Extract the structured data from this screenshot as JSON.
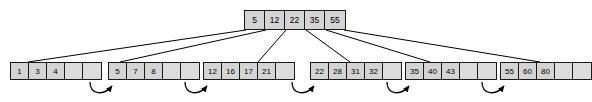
{
  "diagram": {
    "kind": "b-plus-tree",
    "title": "",
    "colors": {
      "cell_fill": "#d4d4d4",
      "empty_cell_fill": "#dcdcdc",
      "border": "#1a1a1a",
      "background": "#ffffff",
      "edge": "#000000"
    },
    "root": {
      "name": "root-node",
      "keys": [
        "5",
        "12",
        "22",
        "35",
        "55"
      ],
      "slots": 5,
      "empty_slots": 0
    },
    "leaves": [
      {
        "name": "leaf-node-1",
        "keys": [
          "1",
          "3",
          "4"
        ],
        "slots": 5,
        "empty_slots": 2
      },
      {
        "name": "leaf-node-2",
        "keys": [
          "5",
          "7",
          "8"
        ],
        "slots": 5,
        "empty_slots": 2
      },
      {
        "name": "leaf-node-3",
        "keys": [
          "12",
          "16",
          "17",
          "21"
        ],
        "slots": 5,
        "empty_slots": 1
      },
      {
        "name": "leaf-node-4",
        "keys": [
          "22",
          "28",
          "31",
          "32"
        ],
        "slots": 5,
        "empty_slots": 1
      },
      {
        "name": "leaf-node-5",
        "keys": [
          "35",
          "40",
          "43"
        ],
        "slots": 5,
        "empty_slots": 2
      },
      {
        "name": "leaf-node-6",
        "keys": [
          "55",
          "60",
          "80"
        ],
        "slots": 5,
        "empty_slots": 2
      }
    ],
    "sibling_links": [
      {
        "name": "sibling-pointer-1-2",
        "from": "leaf-node-1",
        "to": "leaf-node-2"
      },
      {
        "name": "sibling-pointer-2-3",
        "from": "leaf-node-2",
        "to": "leaf-node-3"
      },
      {
        "name": "sibling-pointer-3-4",
        "from": "leaf-node-3",
        "to": "leaf-node-4"
      },
      {
        "name": "sibling-pointer-4-5",
        "from": "leaf-node-4",
        "to": "leaf-node-5"
      },
      {
        "name": "sibling-pointer-5-6",
        "from": "leaf-node-5",
        "to": "leaf-node-6"
      }
    ],
    "child_links": [
      {
        "name": "child-pointer-1",
        "from": "root-node",
        "to": "leaf-node-1"
      },
      {
        "name": "child-pointer-2",
        "from": "root-node",
        "to": "leaf-node-2"
      },
      {
        "name": "child-pointer-3",
        "from": "root-node",
        "to": "leaf-node-3"
      },
      {
        "name": "child-pointer-4",
        "from": "root-node",
        "to": "leaf-node-4"
      },
      {
        "name": "child-pointer-5",
        "from": "root-node",
        "to": "leaf-node-5"
      },
      {
        "name": "child-pointer-6",
        "from": "root-node",
        "to": "leaf-node-6"
      }
    ]
  }
}
